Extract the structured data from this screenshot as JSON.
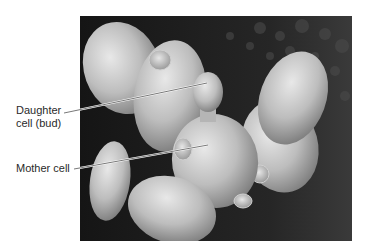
{
  "figure": {
    "type": "scanning electron micrograph",
    "background_color": "#ffffff",
    "photo_background": "#1c1c1c"
  },
  "labels": [
    {
      "id": "daughter",
      "line1": "Daughter",
      "line2": "cell (bud)",
      "target": "daughter-cell"
    },
    {
      "id": "mother",
      "line1": "Mother cell",
      "target": "mother-cell"
    }
  ]
}
